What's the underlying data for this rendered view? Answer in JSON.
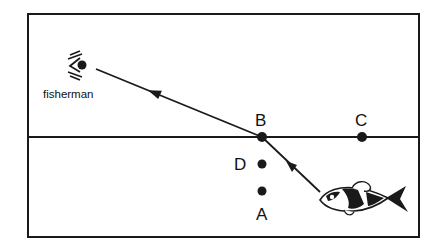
{
  "diagram": {
    "colors": {
      "line": "#1a1a1a",
      "background": "#ffffff"
    },
    "observer": {
      "label": "fisherman",
      "icon": "eye-icon"
    },
    "fish": {
      "icon": "fish-icon"
    },
    "surface": {
      "description": "water surface line"
    },
    "points": [
      {
        "id": "B",
        "label": "B",
        "position": "on water surface, refraction point"
      },
      {
        "id": "C",
        "label": "C",
        "position": "on water surface, right"
      },
      {
        "id": "D",
        "label": "D",
        "position": "below B, under water"
      },
      {
        "id": "A",
        "label": "A",
        "position": "below D, under water"
      }
    ],
    "rays": [
      {
        "from": "fish",
        "to": "B",
        "medium": "water"
      },
      {
        "from": "B",
        "to": "fisherman",
        "medium": "air"
      }
    ]
  }
}
